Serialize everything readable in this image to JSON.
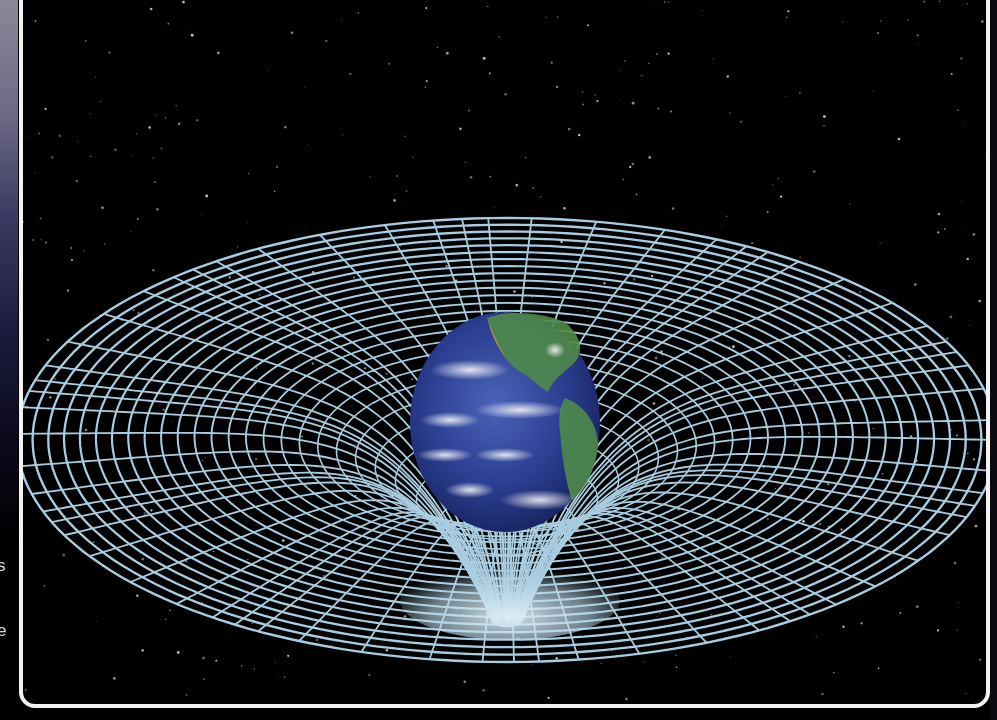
{
  "illustration": {
    "subject": "Earth warping spacetime grid (gravity well)",
    "colors": {
      "background": "#000000",
      "grid": "#a9cde0",
      "grid_funnel_glow": "#cfe6f0",
      "frame": "#f2f2f2",
      "earth_ocean": "#2b3f8f",
      "earth_land": "#4f8a4a"
    }
  },
  "margin_text": {
    "glyph_1": "s",
    "glyph_2": "e"
  }
}
